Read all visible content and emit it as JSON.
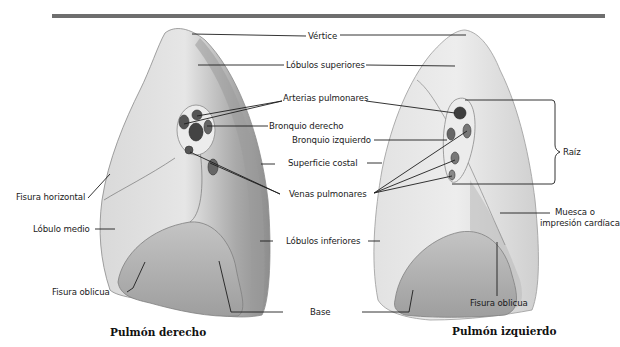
{
  "figure": {
    "header_bar_color": "#6e6e6e",
    "lungs": [
      {
        "id": "right",
        "title": "Pulmón derecho"
      },
      {
        "id": "left",
        "title": "Pulmón izquierdo"
      }
    ],
    "labels": {
      "vertice": "Vértice",
      "lobulos_superiores": "Lóbulos superiores",
      "arterias_pulmonares": "Arterias pulmonares",
      "bronquio_derecho": "Bronquio derecho",
      "bronquio_izquierdo": "Bronquio izquierdo",
      "superficie_costal": "Superficie costal",
      "venas_pulmonares": "Venas pulmonares",
      "lobulos_inferiores": "Lóbulos inferiores",
      "base": "Base",
      "fisura_horizontal": "Fisura horizontal",
      "lobulo_medio": "Lóbulo medio",
      "fisura_oblicua_derecha": "Fisura oblicua",
      "fisura_oblicua_izquierda": "Fisura oblicua",
      "raiz": "Raíz",
      "muesca_line1": "Muesca o",
      "muesca_line2": "impresión cardíaca"
    }
  }
}
